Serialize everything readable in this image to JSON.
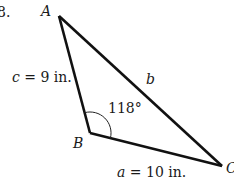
{
  "problem_number": "8.",
  "triangle": {
    "vertices": {
      "A": {
        "label": "A",
        "x": 59,
        "y": 16
      },
      "B": {
        "label": "B",
        "x": 90,
        "y": 133
      },
      "C": {
        "label": "C",
        "x": 222,
        "y": 166
      }
    },
    "sides": {
      "a": {
        "label": "a = 10 in.",
        "var": "a",
        "value": "10 in."
      },
      "b": {
        "label": "b",
        "var": "b"
      },
      "c": {
        "label": "c = 9 in.",
        "var": "c",
        "value": "9 in."
      }
    },
    "angle_B": {
      "label": "118°",
      "value": 118
    }
  },
  "colors": {
    "line": "#111111",
    "text": "#1a1a1a",
    "background": "#ffffff"
  }
}
